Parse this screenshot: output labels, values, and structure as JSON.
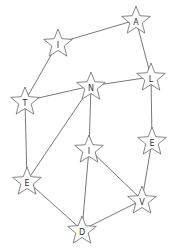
{
  "diagram": {
    "type": "graph",
    "node_shape": "star",
    "colors": {
      "edge": "#555555",
      "node_stroke": "#666666",
      "node_fill": "#ffffff",
      "label": "#333333"
    },
    "nodes": [
      {
        "id": "n0",
        "label": "A",
        "x": 136,
        "y": 20
      },
      {
        "id": "n1",
        "label": "I",
        "x": 58,
        "y": 43
      },
      {
        "id": "n2",
        "label": "T",
        "x": 25,
        "y": 101
      },
      {
        "id": "n3",
        "label": "N",
        "x": 91,
        "y": 86
      },
      {
        "id": "n4",
        "label": "L",
        "x": 151,
        "y": 77
      },
      {
        "id": "n5",
        "label": "E",
        "x": 152,
        "y": 141
      },
      {
        "id": "n6",
        "label": "I",
        "x": 89,
        "y": 149
      },
      {
        "id": "n7",
        "label": "E",
        "x": 27,
        "y": 181
      },
      {
        "id": "n8",
        "label": "V",
        "x": 142,
        "y": 200
      },
      {
        "id": "n9",
        "label": "D",
        "x": 82,
        "y": 230
      }
    ],
    "edges": [
      [
        "n0",
        "n1"
      ],
      [
        "n0",
        "n4"
      ],
      [
        "n1",
        "n2"
      ],
      [
        "n2",
        "n3"
      ],
      [
        "n3",
        "n4"
      ],
      [
        "n2",
        "n7"
      ],
      [
        "n3",
        "n7"
      ],
      [
        "n3",
        "n6"
      ],
      [
        "n4",
        "n5"
      ],
      [
        "n5",
        "n8"
      ],
      [
        "n6",
        "n8"
      ],
      [
        "n6",
        "n9"
      ],
      [
        "n7",
        "n9"
      ],
      [
        "n9",
        "n8"
      ]
    ]
  }
}
